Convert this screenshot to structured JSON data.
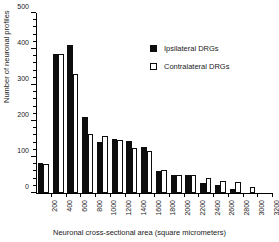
{
  "chart_data": {
    "type": "bar",
    "title": "",
    "xlabel": "Neuronal cross-sectional area (square micrometers)",
    "ylabel": "Number of neuronal profiles",
    "ylim": [
      0,
      500
    ],
    "ytick_major": [
      0,
      100,
      200,
      300,
      400,
      500
    ],
    "ytick_labels": [
      "0",
      "100",
      "200",
      "300",
      "400",
      "500"
    ],
    "ytick_minor_step": 20,
    "grid": false,
    "legend_position": "upper right",
    "categories": [
      "200",
      "400",
      "600",
      "800",
      "1000",
      "1200",
      "1400",
      "1600",
      "1800",
      "2000",
      "2200",
      "2400",
      "2600",
      "2800",
      "3000",
      "3200"
    ],
    "series": [
      {
        "name": "Ipsilateral DRGs",
        "color": "#0d0d0d",
        "fill": "solid",
        "values": [
          83,
          387,
          410,
          212,
          142,
          150,
          144,
          129,
          61,
          50,
          49,
          29,
          22,
          11,
          0,
          0
        ]
      },
      {
        "name": "Contralateral DRGs",
        "color": "#ffffff",
        "fill": "open",
        "values": [
          81,
          385,
          331,
          164,
          157,
          147,
          124,
          116,
          65,
          50,
          49,
          43,
          32,
          30,
          17,
          0
        ]
      }
    ]
  },
  "legend": {
    "items": [
      {
        "label": "Ipsilateral DRGs",
        "swatch": "filled-square"
      },
      {
        "label": "Contralateral DRGs",
        "swatch": "open-square"
      }
    ]
  }
}
